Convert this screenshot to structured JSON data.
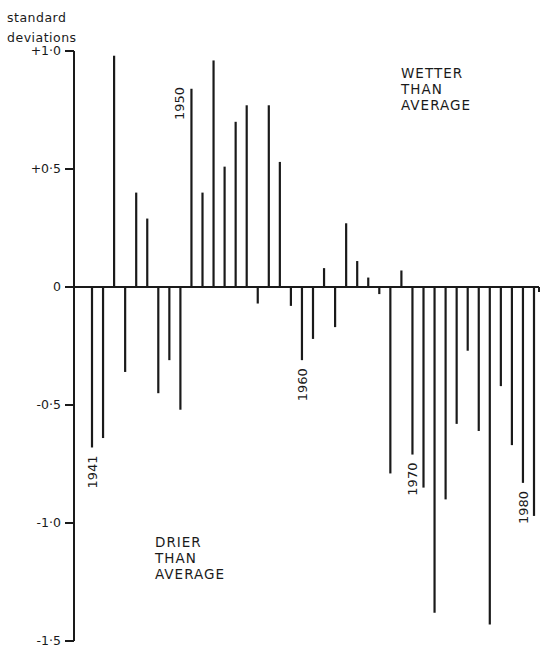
{
  "chart_data": {
    "type": "bar",
    "title": "",
    "xlabel": "",
    "ylabel": "standard deviations",
    "ylabel_lines": [
      "standard",
      "deviations"
    ],
    "ylim": [
      -1.5,
      1.0
    ],
    "yticks": [
      1.0,
      0.5,
      0,
      -0.5,
      -1.0,
      -1.5
    ],
    "ytick_labels": [
      "+1·0",
      "+0·5",
      "0",
      "-0·5",
      "-1·0",
      "-1·5"
    ],
    "grid": false,
    "year_labels": [
      {
        "year": 1941,
        "text": "1941",
        "position": "below"
      },
      {
        "year": 1950,
        "text": "1950",
        "position": "above"
      },
      {
        "year": 1960,
        "text": "1960",
        "position": "below"
      },
      {
        "year": 1970,
        "text": "1970",
        "position": "below"
      },
      {
        "year": 1980,
        "text": "1980",
        "position": "below"
      }
    ],
    "annotations": [
      {
        "lines": [
          "WETTER",
          "THAN",
          "AVERAGE"
        ],
        "region": "upper-right"
      },
      {
        "lines": [
          "DRIER",
          "THAN",
          "AVERAGE"
        ],
        "region": "lower-left"
      }
    ],
    "categories": [
      1941,
      1942,
      1943,
      1944,
      1945,
      1946,
      1947,
      1948,
      1949,
      1950,
      1951,
      1952,
      1953,
      1954,
      1955,
      1956,
      1957,
      1958,
      1959,
      1960,
      1961,
      1962,
      1963,
      1964,
      1965,
      1966,
      1967,
      1968,
      1969,
      1970,
      1971,
      1972,
      1973,
      1974,
      1975,
      1976,
      1977,
      1978,
      1979,
      1980,
      1981
    ],
    "values": [
      -0.68,
      -0.64,
      0.98,
      -0.36,
      0.4,
      0.29,
      -0.45,
      -0.31,
      -0.52,
      0.84,
      0.4,
      0.96,
      0.51,
      0.7,
      0.77,
      -0.07,
      0.77,
      0.53,
      -0.08,
      -0.31,
      -0.22,
      0.08,
      -0.17,
      0.27,
      0.11,
      0.04,
      -0.03,
      -0.79,
      0.07,
      -0.71,
      -0.85,
      -1.38,
      -0.9,
      -0.58,
      -0.27,
      -0.61,
      -1.43,
      -0.42,
      -0.67,
      -0.83,
      -0.97
    ]
  },
  "labels": {
    "ylabel_line1": "standard",
    "ylabel_line2": "deviations",
    "wetter": [
      "WETTER",
      "THAN",
      "AVERAGE"
    ],
    "drier": [
      "DRIER",
      "THAN",
      "AVERAGE"
    ]
  },
  "colors": {
    "ink": "#1a1a1a",
    "background": "#ffffff"
  }
}
